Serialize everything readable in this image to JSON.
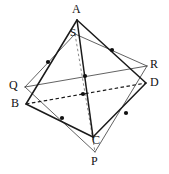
{
  "figure": {
    "canvas": {
      "width": 169,
      "height": 174
    },
    "stroke_color": "#1a1a1a",
    "thin_stroke_color": "#3a3a3a",
    "dot_color": "#111111",
    "background": "#ffffff"
  },
  "labels": {
    "a": "A",
    "s": "S",
    "q": "Q",
    "b": "B",
    "r": "R",
    "d": "D",
    "c": "C",
    "p": "P"
  },
  "vertices": {
    "A": {
      "x": 77,
      "y": 20,
      "label": "A",
      "label_x": 72,
      "label_y": 3
    },
    "B": {
      "x": 26,
      "y": 104,
      "label": "B",
      "label_x": 11,
      "label_y": 97
    },
    "C": {
      "x": 93,
      "y": 137,
      "label": "C",
      "label_x": 92,
      "label_y": 134
    },
    "D": {
      "x": 146,
      "y": 83,
      "label": "D",
      "label_x": 150,
      "label_y": 76
    },
    "P": {
      "x": 95,
      "y": 152,
      "label": "P",
      "label_x": 91,
      "label_y": 155
    },
    "Q": {
      "x": 25,
      "y": 87,
      "label": "Q",
      "label_x": 9,
      "label_y": 79
    },
    "R": {
      "x": 147,
      "y": 66,
      "label": "R",
      "label_x": 150,
      "label_y": 58
    },
    "S": {
      "x": 75,
      "y": 34,
      "label": "S",
      "label_x": 70,
      "label_y": 27
    }
  },
  "midpoints": [
    {
      "name": "midpoint-ab",
      "x": 48,
      "y": 62,
      "r": 2.1
    },
    {
      "name": "midpoint-ad",
      "x": 112,
      "y": 50,
      "r": 2.1
    },
    {
      "name": "midpoint-qr-upper",
      "x": 85,
      "y": 76,
      "r": 2.1
    },
    {
      "name": "midpoint-bd-interior",
      "x": 83,
      "y": 94,
      "r": 2.1
    },
    {
      "name": "midpoint-bc",
      "x": 62,
      "y": 118,
      "r": 2.1
    },
    {
      "name": "midpoint-dc",
      "x": 126,
      "y": 113,
      "r": 2.1
    }
  ],
  "edges": {
    "outer_tetrahedron": [
      {
        "name": "edge-A-B",
        "from": "A",
        "to": "B",
        "style": "solid-thick"
      },
      {
        "name": "edge-A-D",
        "from": "A",
        "to": "D",
        "style": "solid-thick"
      },
      {
        "name": "edge-A-C",
        "from": "A",
        "to": "C",
        "style": "solid-thick"
      },
      {
        "name": "edge-B-C",
        "from": "B",
        "to": "C",
        "style": "solid-thick"
      },
      {
        "name": "edge-D-C",
        "from": "D",
        "to": "C",
        "style": "solid-thick"
      },
      {
        "name": "edge-B-D",
        "from": "B",
        "to": "D",
        "style": "dashed"
      }
    ],
    "inner_tetrahedron": [
      {
        "name": "edge-Q-R",
        "from": "Q",
        "to": "R",
        "style": "solid-thin"
      },
      {
        "name": "edge-Q-S",
        "from": "Q",
        "to": "S",
        "style": "solid-thin"
      },
      {
        "name": "edge-R-S",
        "from": "R",
        "to": "S",
        "style": "solid-thin"
      },
      {
        "name": "edge-Q-P",
        "from": "Q",
        "to": "P",
        "style": "solid-thin"
      },
      {
        "name": "edge-R-P",
        "from": "R",
        "to": "P",
        "style": "solid-thin"
      },
      {
        "name": "edge-S-P",
        "from": "S",
        "to": "P",
        "style": "dashed-faint"
      }
    ]
  }
}
